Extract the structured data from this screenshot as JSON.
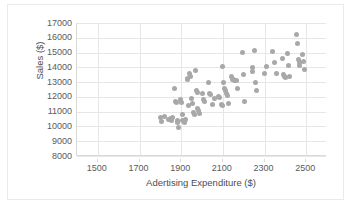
{
  "chart_data": {
    "type": "scatter",
    "title": "",
    "xlabel": "Adertising Expenditure ($)",
    "ylabel": "Sales ($)",
    "xlim": [
      1400,
      2600
    ],
    "ylim": [
      8000,
      17000
    ],
    "xticks": [
      1500,
      1700,
      1900,
      2100,
      2300,
      2500
    ],
    "yticks": [
      8000,
      9000,
      10000,
      11000,
      12000,
      13000,
      14000,
      15000,
      16000,
      17000
    ],
    "xtick_labels": [
      "1500",
      "1700",
      "1900",
      "2100",
      "2300",
      "2500"
    ],
    "ytick_labels": [
      "8000",
      "9000",
      "10000",
      "11000",
      "12000",
      "13000",
      "14000",
      "15000",
      "16000",
      "17000"
    ],
    "grid": "horizontal-and-vertical",
    "legend": "none",
    "marker_color": "#a8a8a8",
    "marker_size": 5,
    "points": [
      {
        "x": 1800,
        "y": 10600
      },
      {
        "x": 1805,
        "y": 10350
      },
      {
        "x": 1820,
        "y": 10650
      },
      {
        "x": 1838,
        "y": 10500
      },
      {
        "x": 1848,
        "y": 10550
      },
      {
        "x": 1852,
        "y": 10400
      },
      {
        "x": 1860,
        "y": 10600
      },
      {
        "x": 1868,
        "y": 12550
      },
      {
        "x": 1872,
        "y": 11700
      },
      {
        "x": 1876,
        "y": 11600
      },
      {
        "x": 1880,
        "y": 10400
      },
      {
        "x": 1884,
        "y": 10250
      },
      {
        "x": 1888,
        "y": 9900
      },
      {
        "x": 1896,
        "y": 11800
      },
      {
        "x": 1900,
        "y": 11650
      },
      {
        "x": 1904,
        "y": 10800
      },
      {
        "x": 1908,
        "y": 10400
      },
      {
        "x": 1914,
        "y": 10300
      },
      {
        "x": 1920,
        "y": 10450
      },
      {
        "x": 1928,
        "y": 13250
      },
      {
        "x": 1932,
        "y": 13150
      },
      {
        "x": 1936,
        "y": 11450
      },
      {
        "x": 1940,
        "y": 13550
      },
      {
        "x": 1944,
        "y": 13350
      },
      {
        "x": 1948,
        "y": 11900
      },
      {
        "x": 1952,
        "y": 11550
      },
      {
        "x": 1958,
        "y": 10950
      },
      {
        "x": 1962,
        "y": 10800
      },
      {
        "x": 1968,
        "y": 13800
      },
      {
        "x": 1972,
        "y": 12400
      },
      {
        "x": 1976,
        "y": 12300
      },
      {
        "x": 1980,
        "y": 11200
      },
      {
        "x": 1984,
        "y": 11050
      },
      {
        "x": 1988,
        "y": 10900
      },
      {
        "x": 2000,
        "y": 12200
      },
      {
        "x": 2008,
        "y": 11800
      },
      {
        "x": 2012,
        "y": 11700
      },
      {
        "x": 2030,
        "y": 12950
      },
      {
        "x": 2038,
        "y": 12250
      },
      {
        "x": 2042,
        "y": 12150
      },
      {
        "x": 2048,
        "y": 11500
      },
      {
        "x": 2060,
        "y": 11900
      },
      {
        "x": 2080,
        "y": 12000
      },
      {
        "x": 2086,
        "y": 11950
      },
      {
        "x": 2092,
        "y": 11500
      },
      {
        "x": 2096,
        "y": 11400
      },
      {
        "x": 2100,
        "y": 14050
      },
      {
        "x": 2104,
        "y": 13000
      },
      {
        "x": 2108,
        "y": 12600
      },
      {
        "x": 2112,
        "y": 12400
      },
      {
        "x": 2116,
        "y": 12200
      },
      {
        "x": 2120,
        "y": 12100
      },
      {
        "x": 2128,
        "y": 11550
      },
      {
        "x": 2140,
        "y": 13400
      },
      {
        "x": 2146,
        "y": 13200
      },
      {
        "x": 2152,
        "y": 13150
      },
      {
        "x": 2158,
        "y": 13100
      },
      {
        "x": 2164,
        "y": 13100
      },
      {
        "x": 2170,
        "y": 12550
      },
      {
        "x": 2196,
        "y": 15000
      },
      {
        "x": 2200,
        "y": 13500
      },
      {
        "x": 2204,
        "y": 11700
      },
      {
        "x": 2240,
        "y": 14000
      },
      {
        "x": 2244,
        "y": 13750
      },
      {
        "x": 2252,
        "y": 15150
      },
      {
        "x": 2256,
        "y": 13000
      },
      {
        "x": 2260,
        "y": 12450
      },
      {
        "x": 2300,
        "y": 13600
      },
      {
        "x": 2310,
        "y": 14050
      },
      {
        "x": 2340,
        "y": 15050
      },
      {
        "x": 2350,
        "y": 14300
      },
      {
        "x": 2356,
        "y": 13600
      },
      {
        "x": 2386,
        "y": 14600
      },
      {
        "x": 2392,
        "y": 13500
      },
      {
        "x": 2396,
        "y": 13350
      },
      {
        "x": 2400,
        "y": 13300
      },
      {
        "x": 2408,
        "y": 14950
      },
      {
        "x": 2414,
        "y": 14100
      },
      {
        "x": 2420,
        "y": 13400
      },
      {
        "x": 2452,
        "y": 16250
      },
      {
        "x": 2456,
        "y": 15600
      },
      {
        "x": 2462,
        "y": 14500
      },
      {
        "x": 2466,
        "y": 14300
      },
      {
        "x": 2470,
        "y": 14150
      },
      {
        "x": 2480,
        "y": 14850
      },
      {
        "x": 2486,
        "y": 14400
      },
      {
        "x": 2490,
        "y": 13850
      }
    ]
  }
}
